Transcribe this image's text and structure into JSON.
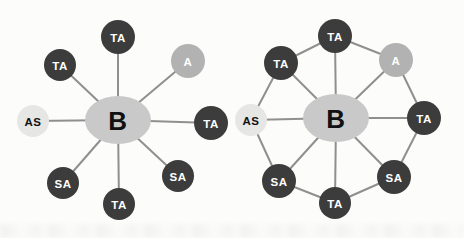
{
  "figure": {
    "background": "#fcfcfb",
    "line_color": "#8f8f8f",
    "line_width": 2,
    "node_types": {
      "hub": {
        "fill": "#c9c9c9",
        "text": "#111111"
      },
      "dark": {
        "fill": "#3c3c3c",
        "text": "#ffffff"
      },
      "medium": {
        "fill": "#b2b2b2",
        "text": "#ffffff"
      },
      "light": {
        "fill": "#e6e6e5",
        "text": "#111111"
      }
    },
    "diagrams": [
      {
        "name": "star-no-ring",
        "nodes": [
          {
            "id": "hub",
            "label": "B",
            "x": 118,
            "y": 120,
            "rx": 33,
            "ry": 24,
            "type": "hub",
            "font_size": 26
          },
          {
            "id": "ta-top",
            "label": "TA",
            "x": 118,
            "y": 37,
            "r": 17,
            "type": "dark"
          },
          {
            "id": "a-topright",
            "label": "A",
            "x": 188,
            "y": 61,
            "r": 17,
            "type": "medium"
          },
          {
            "id": "ta-right",
            "label": "TA",
            "x": 211,
            "y": 123,
            "r": 17,
            "type": "dark"
          },
          {
            "id": "sa-bottomright",
            "label": "SA",
            "x": 178,
            "y": 176,
            "r": 16,
            "type": "dark"
          },
          {
            "id": "ta-bottom",
            "label": "TA",
            "x": 119,
            "y": 204,
            "r": 16,
            "type": "dark"
          },
          {
            "id": "sa-bottomleft",
            "label": "SA",
            "x": 63,
            "y": 183,
            "r": 16,
            "type": "dark"
          },
          {
            "id": "as-left",
            "label": "AS",
            "x": 33,
            "y": 121,
            "r": 16,
            "type": "light"
          },
          {
            "id": "ta-topleft",
            "label": "TA",
            "x": 60,
            "y": 65,
            "r": 16,
            "type": "dark"
          }
        ],
        "edges": [
          [
            "hub",
            "ta-top"
          ],
          [
            "hub",
            "a-topright"
          ],
          [
            "hub",
            "ta-right"
          ],
          [
            "hub",
            "sa-bottomright"
          ],
          [
            "hub",
            "ta-bottom"
          ],
          [
            "hub",
            "sa-bottomleft"
          ],
          [
            "hub",
            "as-left"
          ],
          [
            "hub",
            "ta-topleft"
          ]
        ]
      },
      {
        "name": "star-with-ring",
        "nodes": [
          {
            "id": "hub",
            "label": "B",
            "x": 336,
            "y": 118,
            "rx": 33,
            "ry": 24,
            "type": "hub",
            "font_size": 26
          },
          {
            "id": "ta-top",
            "label": "TA",
            "x": 335,
            "y": 36,
            "r": 17,
            "type": "dark"
          },
          {
            "id": "a-topright",
            "label": "A",
            "x": 396,
            "y": 60,
            "r": 17,
            "type": "medium"
          },
          {
            "id": "ta-right",
            "label": "TA",
            "x": 424,
            "y": 118,
            "r": 17,
            "type": "dark"
          },
          {
            "id": "sa-bottomright",
            "label": "SA",
            "x": 394,
            "y": 177,
            "r": 17,
            "type": "dark"
          },
          {
            "id": "ta-bottom",
            "label": "TA",
            "x": 335,
            "y": 203,
            "r": 16,
            "type": "dark"
          },
          {
            "id": "sa-bottomleft",
            "label": "SA",
            "x": 279,
            "y": 181,
            "r": 17,
            "type": "dark"
          },
          {
            "id": "as-left",
            "label": "AS",
            "x": 251,
            "y": 120,
            "r": 16,
            "type": "light"
          },
          {
            "id": "ta-topleft",
            "label": "TA",
            "x": 281,
            "y": 63,
            "r": 17,
            "type": "dark"
          }
        ],
        "edges": [
          [
            "hub",
            "ta-top"
          ],
          [
            "hub",
            "a-topright"
          ],
          [
            "hub",
            "ta-right"
          ],
          [
            "hub",
            "sa-bottomright"
          ],
          [
            "hub",
            "ta-bottom"
          ],
          [
            "hub",
            "sa-bottomleft"
          ],
          [
            "hub",
            "as-left"
          ],
          [
            "hub",
            "ta-topleft"
          ],
          [
            "ta-top",
            "a-topright"
          ],
          [
            "a-topright",
            "ta-right"
          ],
          [
            "ta-right",
            "sa-bottomright"
          ],
          [
            "sa-bottomright",
            "ta-bottom"
          ],
          [
            "ta-bottom",
            "sa-bottomleft"
          ],
          [
            "sa-bottomleft",
            "as-left"
          ],
          [
            "as-left",
            "ta-topleft"
          ],
          [
            "ta-topleft",
            "ta-top"
          ]
        ]
      }
    ]
  }
}
